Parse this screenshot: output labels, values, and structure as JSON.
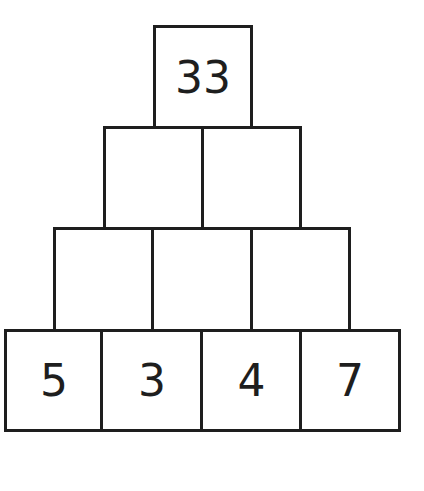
{
  "pyramid": {
    "rows": [
      {
        "cells": [
          "33"
        ]
      },
      {
        "cells": [
          "",
          ""
        ]
      },
      {
        "cells": [
          "",
          "",
          ""
        ]
      },
      {
        "cells": [
          "5",
          "3",
          "4",
          "7"
        ]
      }
    ]
  },
  "colors": {
    "border": "#1e1e1e",
    "background": "#ffffff",
    "text": "#1e1e1e"
  }
}
